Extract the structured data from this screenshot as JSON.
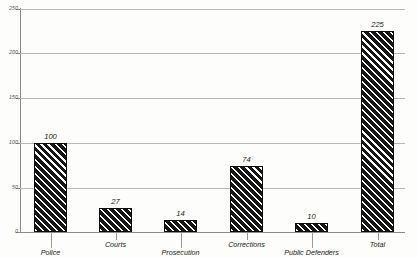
{
  "chart_data": {
    "type": "bar",
    "title": "",
    "subtitle": "",
    "xlabel": "",
    "ylabel": "",
    "categories": [
      "Police",
      "Courts",
      "Prosecution",
      "Corrections",
      "Public Defenders",
      "Total"
    ],
    "values": [
      100,
      27,
      14,
      74,
      10,
      225
    ],
    "value_labels": [
      "100",
      "27",
      "14",
      "74",
      "10",
      "225"
    ],
    "ylim": [
      0,
      250
    ],
    "yticks": [
      0,
      50,
      100,
      150,
      200,
      250
    ],
    "ytick_labels": [
      "0",
      "50",
      "100",
      "150",
      "200",
      "250"
    ],
    "grid": true,
    "grid_axis": "y",
    "legend": false,
    "legend_position": "none",
    "bar_fill": "#161616",
    "bar_hatch": "diagonal-forward-slash-white-on-black",
    "gridline_color": "#b9b9b9",
    "axis_color": "#8a8a8a",
    "background": "#fdfdfc"
  }
}
